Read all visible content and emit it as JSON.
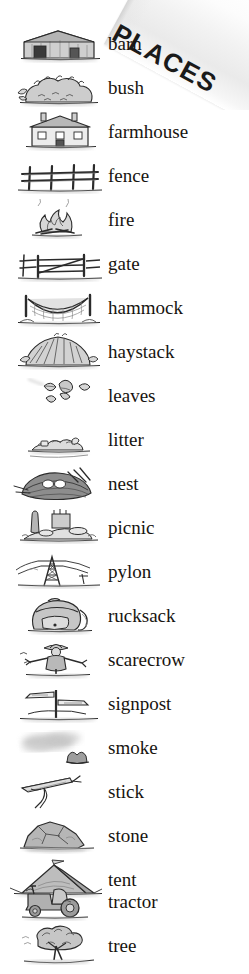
{
  "page": {
    "title": "PLACES",
    "background_color": "#ffffff",
    "text_color": "#17140f",
    "banner_color": "#eeeeee",
    "width": 249,
    "height": 974
  },
  "header": {
    "title": "PLACES",
    "rotation_degrees": 28.5,
    "style": "bold sans-serif on angled light-gray banner"
  },
  "word_list": {
    "count": 20,
    "row_height": 44,
    "first_row_top": 22,
    "items": [
      {
        "label": "barn",
        "icon": "barn-illustration",
        "top": 22
      },
      {
        "label": "bush",
        "icon": "bush-illustration",
        "top": 66
      },
      {
        "label": "farmhouse",
        "icon": "farmhouse-illustration",
        "top": 110
      },
      {
        "label": "fence",
        "icon": "fence-illustration",
        "top": 154
      },
      {
        "label": "fire",
        "icon": "fire-illustration",
        "top": 198
      },
      {
        "label": "gate",
        "icon": "gate-illustration",
        "top": 242
      },
      {
        "label": "hammock",
        "icon": "hammock-illustration",
        "top": 286
      },
      {
        "label": "haystack",
        "icon": "haystack-illustration",
        "top": 330
      },
      {
        "label": "leaves",
        "icon": "leaves-illustration",
        "top": 374
      },
      {
        "label": "litter",
        "icon": "litter-illustration",
        "top": 418
      },
      {
        "label": "nest",
        "icon": "nest-illustration",
        "top": 462
      },
      {
        "label": "picnic",
        "icon": "picnic-illustration",
        "top": 506
      },
      {
        "label": "pylon",
        "icon": "pylon-illustration",
        "top": 550
      },
      {
        "label": "rucksack",
        "icon": "rucksack-illustration",
        "top": 594
      },
      {
        "label": "scarecrow",
        "icon": "scarecrow-illustration",
        "top": 638
      },
      {
        "label": "signpost",
        "icon": "signpost-illustration",
        "top": 682
      },
      {
        "label": "smoke",
        "icon": "smoke-illustration",
        "top": 726
      },
      {
        "label": "stick",
        "icon": "stick-illustration",
        "top": 770
      },
      {
        "label": "stone",
        "icon": "stone-illustration",
        "top": 814
      },
      {
        "label": "tent",
        "icon": "tent-illustration",
        "top": 858
      },
      {
        "label": "tractor",
        "icon": "tractor-illustration",
        "top": 880
      },
      {
        "label": "tree",
        "icon": "tree-illustration",
        "top": 924
      }
    ]
  }
}
